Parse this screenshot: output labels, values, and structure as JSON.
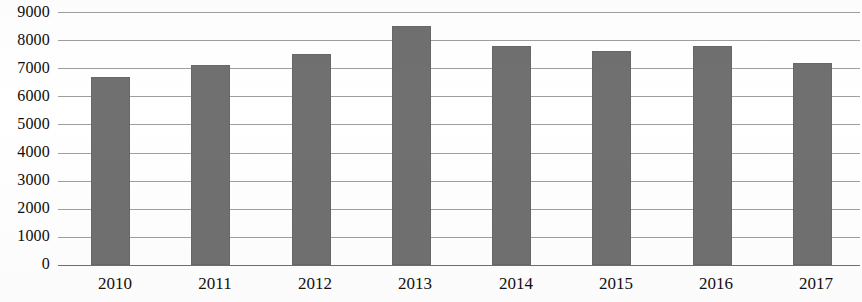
{
  "chart_data": {
    "type": "bar",
    "title": "",
    "subtitle": "",
    "xlabel": "",
    "ylabel": "",
    "categories": [
      "2010",
      "2011",
      "2012",
      "2013",
      "2014",
      "2015",
      "2016",
      "2017"
    ],
    "values": [
      6700,
      7100,
      7500,
      8500,
      7800,
      7600,
      7800,
      7200
    ],
    "series": [
      {
        "name": "",
        "values": [
          6700,
          7100,
          7500,
          8500,
          7800,
          7600,
          7800,
          7200
        ]
      }
    ],
    "ylim": [
      0,
      9000
    ],
    "ytick_step": 1000,
    "ytick_labels": [
      "9000",
      "8000",
      "7000",
      "6000",
      "5000",
      "4000",
      "3000",
      "2000",
      "1000",
      "0"
    ],
    "ytick_values": [
      9000,
      8000,
      7000,
      6000,
      5000,
      4000,
      3000,
      2000,
      1000,
      0
    ],
    "grid": true,
    "grid_axis": "y",
    "legend": false,
    "legend_position": "none",
    "bar_color": "#707070",
    "grid_color": "#8e8e8e",
    "axis_color": "#6f6f6f",
    "text_color": "#0d0d0d",
    "background_color": "#ffffff",
    "annotations": []
  }
}
